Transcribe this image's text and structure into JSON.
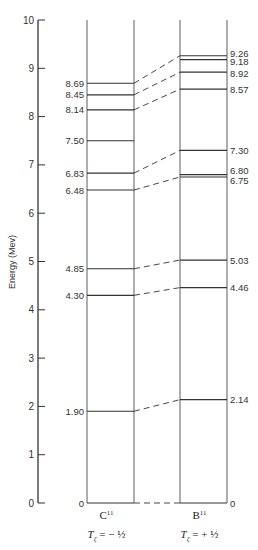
{
  "chart_data": {
    "type": "energy-level-diagram",
    "title": "",
    "ylabel": "Energy (Mev)",
    "ylim": [
      0,
      10
    ],
    "yticks": [
      0,
      1,
      2,
      3,
      4,
      5,
      6,
      7,
      8,
      9,
      10
    ],
    "columns": [
      {
        "nucleus": "C",
        "mass_number": "11",
        "isospin_label": "T",
        "isospin_sub": "ζ",
        "isospin_value": "= − ½",
        "levels": [
          0,
          1.9,
          4.3,
          4.85,
          6.48,
          6.83,
          7.5,
          8.14,
          8.45,
          8.69
        ],
        "level_labels": [
          "0",
          "1.90",
          "4.30",
          "4.85",
          "6.48",
          "6.83",
          "7.50",
          "8.14",
          "8.45",
          "8.69"
        ]
      },
      {
        "nucleus": "B",
        "mass_number": "11",
        "isospin_label": "T",
        "isospin_sub": "ζ",
        "isospin_value": "= + ½",
        "levels": [
          0,
          2.14,
          4.46,
          5.03,
          6.75,
          6.8,
          7.3,
          8.57,
          8.92,
          9.18,
          9.26
        ],
        "level_labels": [
          "0",
          "2.14",
          "4.46",
          "5.03",
          "6.75",
          "6.80",
          "7.30",
          "8.57",
          "8.92",
          "9.18",
          "9.26"
        ]
      }
    ],
    "correspondences": [
      [
        0,
        0
      ],
      [
        1.9,
        2.14
      ],
      [
        4.3,
        4.46
      ],
      [
        4.85,
        5.03
      ],
      [
        6.48,
        6.75
      ],
      [
        6.83,
        7.3
      ],
      [
        8.14,
        8.57
      ],
      [
        8.45,
        8.92
      ],
      [
        8.69,
        9.26
      ]
    ]
  },
  "layout": {
    "y_zero_px": 503,
    "y_top_px": 20,
    "axis_x": 38,
    "c_left": 87,
    "c_right": 134,
    "b_left": 180,
    "b_right": 227,
    "line_color": "#333333"
  }
}
